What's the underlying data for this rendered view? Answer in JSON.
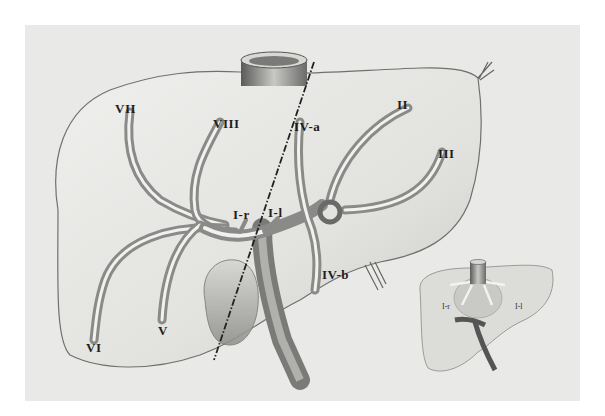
{
  "figure": {
    "main_labels": {
      "seg_vii": "VII",
      "seg_viii": "VIII",
      "seg_iva": "IV-a",
      "seg_ii": "II",
      "seg_iii": "III",
      "seg_ir": "I-r",
      "seg_il": "I-l",
      "seg_ivb": "IV-b",
      "seg_vi": "VI",
      "seg_v": "V"
    },
    "inset_labels": {
      "seg_ir": "I-r",
      "seg_il": "I-l"
    },
    "colors": {
      "background": "#ffffff",
      "panel": "#e9e9e7",
      "liver_fill": "#dededb",
      "outline": "#6a6a6a",
      "vessel_dark": "#8a8a88",
      "vessel_light": "#f2f2f0",
      "dash_line": "#222222"
    }
  }
}
